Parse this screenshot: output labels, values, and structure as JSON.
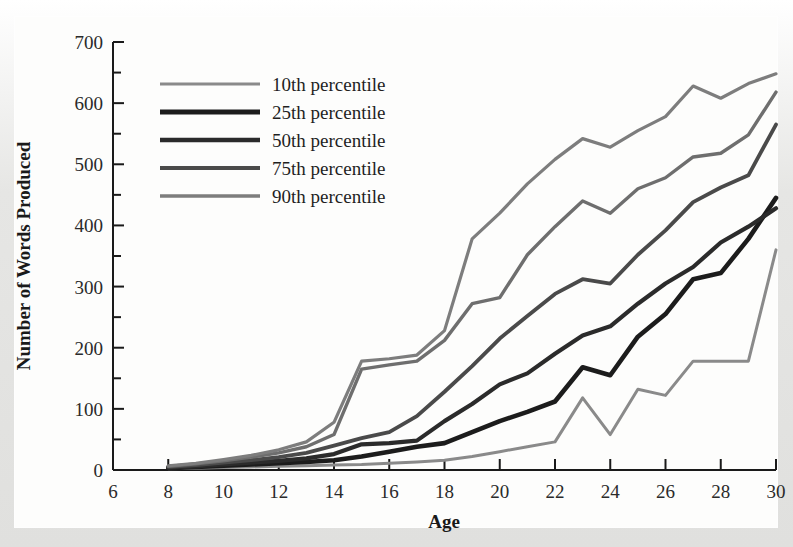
{
  "chart_data": {
    "type": "line",
    "title": "",
    "xlabel": "Age",
    "ylabel": "Number of Words Produced",
    "xlim": [
      6,
      30
    ],
    "ylim": [
      0,
      700
    ],
    "grid": false,
    "legend_position": "top-left",
    "x_ticks": [
      6,
      8,
      10,
      12,
      14,
      16,
      18,
      20,
      22,
      24,
      26,
      28,
      30
    ],
    "x_tick_labels": [
      "6",
      "8",
      "10",
      "12",
      "14",
      "16",
      "18",
      "20",
      "22",
      "24",
      "26",
      "28",
      "30"
    ],
    "y_ticks": [
      0,
      100,
      200,
      300,
      400,
      500,
      600,
      700
    ],
    "y_tick_labels": [
      "0",
      "100",
      "200",
      "300",
      "400",
      "500",
      "600",
      "700"
    ],
    "y_minor_ticks": [
      50,
      150,
      250,
      350,
      450,
      550,
      650
    ],
    "x": [
      8,
      9,
      10,
      11,
      12,
      13,
      14,
      15,
      16,
      17,
      18,
      19,
      20,
      21,
      22,
      23,
      24,
      25,
      26,
      27,
      28,
      29,
      30
    ],
    "series": [
      {
        "name": "10th percentile",
        "color": "#8a8a8a",
        "width": 3.0,
        "values": [
          2,
          3,
          4,
          5,
          6,
          7,
          8,
          9,
          11,
          13,
          16,
          22,
          30,
          38,
          46,
          118,
          58,
          132,
          122,
          178,
          178,
          178,
          360
        ]
      },
      {
        "name": "25th percentile",
        "color": "#1c1c1c",
        "width": 4.6,
        "values": [
          3,
          5,
          7,
          9,
          11,
          13,
          16,
          22,
          30,
          38,
          44,
          62,
          80,
          95,
          112,
          168,
          155,
          218,
          255,
          312,
          322,
          378,
          445
        ]
      },
      {
        "name": "50th percentile",
        "color": "#2b2b2b",
        "width": 4.2,
        "values": [
          4,
          6,
          9,
          12,
          15,
          19,
          26,
          42,
          44,
          48,
          80,
          108,
          140,
          158,
          190,
          220,
          235,
          272,
          305,
          332,
          372,
          398,
          428
        ]
      },
      {
        "name": "75th percentile",
        "color": "#4a4a4a",
        "width": 3.8,
        "values": [
          5,
          8,
          12,
          16,
          21,
          28,
          40,
          52,
          62,
          88,
          128,
          170,
          215,
          252,
          288,
          312,
          305,
          352,
          392,
          438,
          462,
          482,
          565
        ]
      },
      {
        "name": "90th percentile",
        "color": "#6e6e6e",
        "width": 3.4,
        "values": [
          6,
          10,
          15,
          21,
          28,
          38,
          58,
          165,
          172,
          178,
          212,
          272,
          282,
          352,
          398,
          440,
          420,
          460,
          478,
          512,
          518,
          548,
          618
        ]
      },
      {
        "name": "90th percentile upper",
        "color": "#7d7d7d",
        "width": 3.2,
        "values": [
          7,
          11,
          17,
          24,
          33,
          46,
          78,
          178,
          182,
          188,
          228,
          378,
          420,
          468,
          508,
          542,
          528,
          555,
          578,
          628,
          608,
          632,
          648
        ]
      }
    ],
    "legend": [
      {
        "label": "10th percentile",
        "color": "#8a8a8a",
        "width": 3.0
      },
      {
        "label": "25th percentile",
        "color": "#1c1c1c",
        "width": 5.2
      },
      {
        "label": "50th percentile",
        "color": "#2b2b2b",
        "width": 4.6
      },
      {
        "label": "75th percentile",
        "color": "#4a4a4a",
        "width": 4.0
      },
      {
        "label": "90th percentile",
        "color": "#7d7d7d",
        "width": 3.4
      }
    ]
  }
}
